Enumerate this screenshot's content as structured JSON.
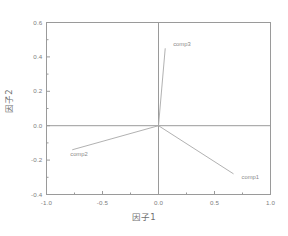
{
  "chart_data": {
    "type": "scatter",
    "title": "",
    "subtitle": "",
    "xlabel": "因子1",
    "ylabel": "因子2",
    "xlim": [
      -1.0,
      1.0
    ],
    "ylim": [
      -0.4,
      0.6
    ],
    "xticks": [
      "-1.0",
      "-0.5",
      "0.0",
      "0.5",
      "1.0"
    ],
    "xtick_values": [
      -1.0,
      -0.5,
      0.0,
      0.5,
      1.0
    ],
    "yticks": [
      "0.6",
      "0.4",
      "0.2",
      "0.0",
      "-0.2",
      "-0.4"
    ],
    "ytick_values": [
      0.6,
      0.4,
      0.2,
      0.0,
      -0.2,
      -0.4
    ],
    "grid": false,
    "zero_lines": true,
    "legend": "none",
    "plot_style": "loading-vector-plot",
    "points": [
      {
        "label": "comp3",
        "x": 0.06,
        "y": 0.45,
        "label_dx": 8,
        "label_dy": -4
      },
      {
        "label": "comp2",
        "x": -0.77,
        "y": -0.14,
        "label_dx": -2,
        "label_dy": 4
      },
      {
        "label": "comp1",
        "x": 0.67,
        "y": -0.28,
        "label_dx": 8,
        "label_dy": 3
      }
    ],
    "vectors_from_origin": true,
    "origin": [
      0.0,
      0.0
    ],
    "line_color": "#a8a8a8",
    "axis_color": "#9a9a9a",
    "frame_color": "#9a9a9a",
    "text_color": "#7d7d7d",
    "background_color": "#ffffff"
  }
}
